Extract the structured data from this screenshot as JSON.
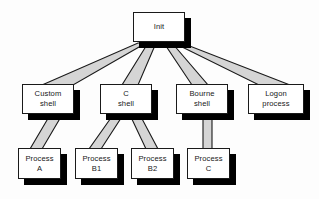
{
  "diagram": {
    "type": "tree-hierarchy",
    "background_color": "#fdfdfd",
    "node_fill_color": "#ffffff",
    "node_border_color": "#1a1a1a",
    "node_shadow_color": "#000000",
    "connector_fill_color": "#d5d5d5",
    "connector_stroke_color": "#1a1a1a",
    "levels": 3,
    "nodes": [
      {
        "id": "init",
        "label": "Init",
        "level": 0,
        "x": 133,
        "y": 12,
        "w": 52,
        "h": 30
      },
      {
        "id": "custom-shell",
        "label": "Custom\nshell",
        "level": 1,
        "x": 22,
        "y": 84,
        "w": 52,
        "h": 30
      },
      {
        "id": "c-shell",
        "label": "C\nshell",
        "level": 1,
        "x": 100,
        "y": 84,
        "w": 52,
        "h": 30
      },
      {
        "id": "bourne-shell",
        "label": "Bourne\nshell",
        "level": 1,
        "x": 176,
        "y": 84,
        "w": 52,
        "h": 30
      },
      {
        "id": "logon-process",
        "label": "Logon\nprocess",
        "level": 1,
        "x": 248,
        "y": 84,
        "w": 56,
        "h": 30
      },
      {
        "id": "process-a",
        "label": "Process\nA",
        "level": 2,
        "x": 18,
        "y": 148,
        "w": 43,
        "h": 31
      },
      {
        "id": "process-b1",
        "label": "Process\nB1",
        "level": 2,
        "x": 75,
        "y": 148,
        "w": 43,
        "h": 31
      },
      {
        "id": "process-b2",
        "label": "Process\nB2",
        "level": 2,
        "x": 131,
        "y": 148,
        "w": 43,
        "h": 31
      },
      {
        "id": "process-c",
        "label": "Process\nC",
        "level": 2,
        "x": 187,
        "y": 148,
        "w": 43,
        "h": 31
      }
    ],
    "edges": [
      {
        "from": "init",
        "to": "custom-shell"
      },
      {
        "from": "init",
        "to": "c-shell"
      },
      {
        "from": "init",
        "to": "bourne-shell"
      },
      {
        "from": "init",
        "to": "logon-process"
      },
      {
        "from": "custom-shell",
        "to": "process-a"
      },
      {
        "from": "c-shell",
        "to": "process-b1"
      },
      {
        "from": "c-shell",
        "to": "process-b2"
      },
      {
        "from": "bourne-shell",
        "to": "process-c"
      }
    ]
  }
}
